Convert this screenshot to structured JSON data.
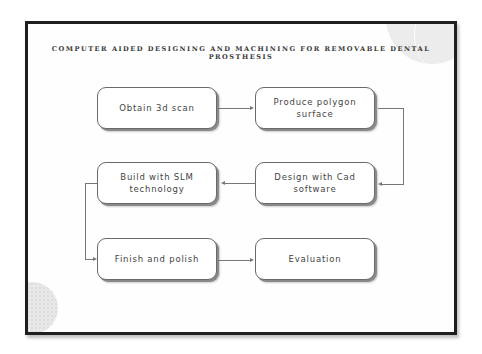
{
  "slide": {
    "title": "COMPUTER AIDED DESIGNING AND MACHINING FOR REMOVABLE DENTAL PROSTHESIS"
  },
  "flow": {
    "steps": [
      {
        "label": "Obtain 3d scan"
      },
      {
        "label": "Produce polygon surface"
      },
      {
        "label": "Design with Cad software"
      },
      {
        "label": "Build with SLM technology"
      },
      {
        "label": "Finish and polish"
      },
      {
        "label": "Evaluation"
      }
    ]
  },
  "colors": {
    "frame": "#1f1f1f",
    "box_border": "#6a6a6a",
    "text": "#444444",
    "connector": "#777777"
  }
}
